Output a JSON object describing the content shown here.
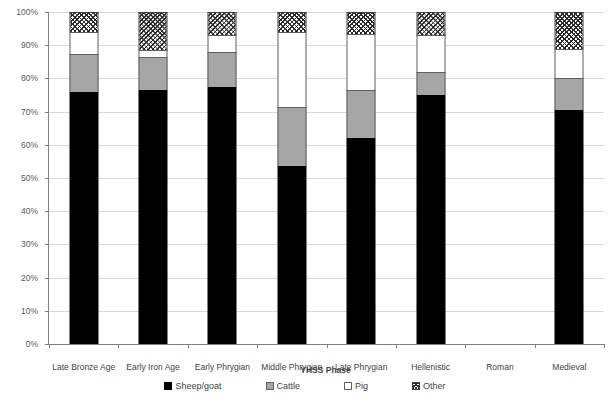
{
  "chart_data": {
    "type": "bar",
    "subtype": "stacked-100-percent",
    "title": "",
    "xlabel": "YHSS Phase",
    "ylabel": "Proportion of total NISP by taxon",
    "ylim": [
      0,
      100
    ],
    "ytick_labels": [
      "100%",
      "90%",
      "80%",
      "70%",
      "60%",
      "50%",
      "40%",
      "30%",
      "20%",
      "10%",
      "0%"
    ],
    "ytick_values": [
      100,
      90,
      80,
      70,
      60,
      50,
      40,
      30,
      20,
      10,
      0
    ],
    "grid": true,
    "legend_position": "bottom",
    "categories": [
      "Late Bronze Age",
      "Early Iron Age",
      "Early Phrygian",
      "Middle Phrygian",
      "Late Phrygian",
      "Hellenistic",
      "Roman",
      "Medieval"
    ],
    "series": [
      {
        "name": "Sheep/goat",
        "color": "#000000",
        "pattern": "solid",
        "values": [
          76,
          76.5,
          77.5,
          53.5,
          62,
          75,
          null,
          70.5
        ]
      },
      {
        "name": "Cattle",
        "color": "#a6a6a6",
        "pattern": "solid",
        "values": [
          11.5,
          10,
          10.5,
          18,
          14.5,
          7,
          null,
          9.5
        ]
      },
      {
        "name": "Pig",
        "color": "#ffffff",
        "pattern": "solid",
        "values": [
          6.5,
          2,
          5,
          22.5,
          17,
          11,
          null,
          9
        ]
      },
      {
        "name": "Other",
        "color": "#ffffff",
        "pattern": "crosshatch",
        "values": [
          6,
          11.5,
          7,
          6,
          6.5,
          7,
          null,
          11
        ]
      }
    ]
  },
  "legend": {
    "entries": [
      {
        "label": "Sheep/goat",
        "swatch": "black-square-icon"
      },
      {
        "label": "Cattle",
        "swatch": "gray-square-icon"
      },
      {
        "label": "Pig",
        "swatch": "white-square-icon"
      },
      {
        "label": "Other",
        "swatch": "hatched-square-icon"
      }
    ]
  }
}
